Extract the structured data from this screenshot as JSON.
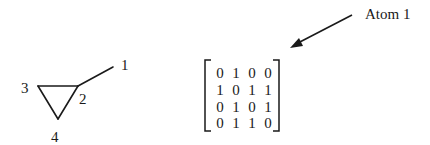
{
  "molecule": {
    "atoms": [
      {
        "id": "1",
        "label": "1"
      },
      {
        "id": "2",
        "label": "2"
      },
      {
        "id": "3",
        "label": "3"
      },
      {
        "id": "4",
        "label": "4"
      }
    ],
    "bonds": [
      [
        "1",
        "2"
      ],
      [
        "2",
        "3"
      ],
      [
        "2",
        "4"
      ],
      [
        "3",
        "4"
      ]
    ]
  },
  "matrix": {
    "rows": [
      [
        "0",
        "1",
        "0",
        "0"
      ],
      [
        "1",
        "0",
        "1",
        "1"
      ],
      [
        "0",
        "1",
        "0",
        "1"
      ],
      [
        "0",
        "1",
        "1",
        "0"
      ]
    ]
  },
  "annotation": {
    "label": "Atom 1"
  },
  "colors": {
    "ink": "#1a1a1a",
    "background": "#ffffff"
  }
}
